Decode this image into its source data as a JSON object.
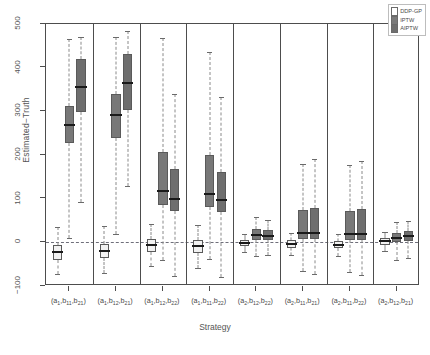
{
  "chart_data": {
    "type": "boxplot",
    "title": "",
    "xlabel": "Strategy",
    "ylabel": "Estimated−Truth",
    "ylim": [
      -100,
      500
    ],
    "yticks": [
      -100,
      0,
      100,
      200,
      300,
      400,
      500
    ],
    "grid": false,
    "zero_reference_line": 0,
    "legend": {
      "position": "top-right",
      "entries": [
        {
          "label": "DDP-GP",
          "color": "#ffffff"
        },
        {
          "label": "IPTW",
          "color": "#7a7a7a"
        },
        {
          "label": "AIPTW",
          "color": "#6e6e6e"
        }
      ]
    },
    "categories": [
      "(a₁,b₁₁,b₂₁)",
      "(a₁,b₁₂,b₂₁)",
      "(a₁,b₁₂,b₂₂)",
      "(a₁,b₁₁,b₂₂)",
      "(a₂,b₁₂,b₂₂)",
      "(a₂,b₁₁,b₂₁)",
      "(a₂,b₁₁,b₂₂)",
      "(a₂,b₁₂,b₂₁)"
    ],
    "category_parts": [
      {
        "a": "a",
        "a_sub": "1",
        "b1": "b",
        "b1_sub": "11",
        "b2": "b",
        "b2_sub": "21"
      },
      {
        "a": "a",
        "a_sub": "1",
        "b1": "b",
        "b1_sub": "12",
        "b2": "b",
        "b2_sub": "21"
      },
      {
        "a": "a",
        "a_sub": "1",
        "b1": "b",
        "b1_sub": "12",
        "b2": "b",
        "b2_sub": "22"
      },
      {
        "a": "a",
        "a_sub": "1",
        "b1": "b",
        "b1_sub": "11",
        "b2": "b",
        "b2_sub": "22"
      },
      {
        "a": "a",
        "a_sub": "2",
        "b1": "b",
        "b1_sub": "12",
        "b2": "b",
        "b2_sub": "22"
      },
      {
        "a": "a",
        "a_sub": "2",
        "b1": "b",
        "b1_sub": "11",
        "b2": "b",
        "b2_sub": "21"
      },
      {
        "a": "a",
        "a_sub": "2",
        "b1": "b",
        "b1_sub": "11",
        "b2": "b",
        "b2_sub": "22"
      },
      {
        "a": "a",
        "a_sub": "2",
        "b1": "b",
        "b1_sub": "12",
        "b2": "b",
        "b2_sub": "21"
      }
    ],
    "series": [
      {
        "name": "DDP-GP",
        "color": "#f2f2f2",
        "boxes": [
          {
            "lower_whisker": -72,
            "q1": -40,
            "median": -23,
            "q3": -5,
            "upper_whisker": 35
          },
          {
            "lower_whisker": -70,
            "q1": -36,
            "median": -20,
            "q3": -3,
            "upper_whisker": 38
          },
          {
            "lower_whisker": -55,
            "q1": -22,
            "median": -6,
            "q3": 8,
            "upper_whisker": 42
          },
          {
            "lower_whisker": -58,
            "q1": -25,
            "median": -8,
            "q3": 6,
            "upper_whisker": 40
          },
          {
            "lower_whisker": -22,
            "q1": -9,
            "median": -2,
            "q3": 5,
            "upper_whisker": 18
          },
          {
            "lower_whisker": -30,
            "q1": -12,
            "median": -4,
            "q3": 5,
            "upper_whisker": 22
          },
          {
            "lower_whisker": -32,
            "q1": -14,
            "median": -5,
            "q3": 4,
            "upper_whisker": 20
          },
          {
            "lower_whisker": -20,
            "q1": -6,
            "median": 2,
            "q3": 9,
            "upper_whisker": 24
          }
        ]
      },
      {
        "name": "IPTW",
        "color": "#787878",
        "boxes": [
          {
            "lower_whisker": 10,
            "q1": 228,
            "median": 268,
            "q3": 312,
            "upper_whisker": 466
          },
          {
            "lower_whisker": 20,
            "q1": 240,
            "median": 292,
            "q3": 340,
            "upper_whisker": 470
          },
          {
            "lower_whisker": -40,
            "q1": 85,
            "median": 117,
            "q3": 208,
            "upper_whisker": 468
          },
          {
            "lower_whisker": -38,
            "q1": 80,
            "median": 110,
            "q3": 200,
            "upper_whisker": 436
          },
          {
            "lower_whisker": -32,
            "q1": 6,
            "median": 17,
            "q3": 30,
            "upper_whisker": 58
          },
          {
            "lower_whisker": -66,
            "q1": 8,
            "median": 22,
            "q3": 75,
            "upper_whisker": 180
          },
          {
            "lower_whisker": -68,
            "q1": 6,
            "median": 20,
            "q3": 72,
            "upper_whisker": 178
          },
          {
            "lower_whisker": -40,
            "q1": 0,
            "median": 10,
            "q3": 22,
            "upper_whisker": 46
          }
        ]
      },
      {
        "name": "AIPTW",
        "color": "#6e6e6e",
        "boxes": [
          {
            "lower_whisker": 92,
            "q1": 298,
            "median": 356,
            "q3": 420,
            "upper_whisker": 470
          },
          {
            "lower_whisker": 128,
            "q1": 302,
            "median": 366,
            "q3": 432,
            "upper_whisker": 484
          },
          {
            "lower_whisker": -78,
            "q1": 72,
            "median": 100,
            "q3": 168,
            "upper_whisker": 340
          },
          {
            "lower_whisker": -80,
            "q1": 70,
            "median": 98,
            "q3": 160,
            "upper_whisker": 332
          },
          {
            "lower_whisker": -30,
            "q1": 5,
            "median": 14,
            "q3": 28,
            "upper_whisker": 52
          },
          {
            "lower_whisker": -72,
            "q1": 8,
            "median": 22,
            "q3": 78,
            "upper_whisker": 190
          },
          {
            "lower_whisker": -74,
            "q1": 6,
            "median": 20,
            "q3": 76,
            "upper_whisker": 186
          },
          {
            "lower_whisker": -36,
            "q1": 2,
            "median": 14,
            "q3": 26,
            "upper_whisker": 48
          }
        ]
      }
    ]
  }
}
